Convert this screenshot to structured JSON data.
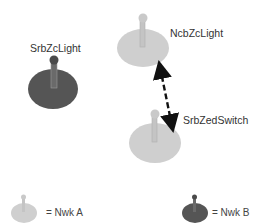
{
  "diagram": {
    "nodes": [
      {
        "id": "srbzclight",
        "label": "SrbZcLight",
        "network": "Nwk B"
      },
      {
        "id": "ncbzclight",
        "label": "NcbZcLight",
        "network": "Nwk A"
      },
      {
        "id": "srbzedswitch",
        "label": "SrbZedSwitch",
        "network": "Nwk A"
      }
    ],
    "edges": [
      {
        "from": "ncbzclight",
        "to": "srbzedswitch",
        "style": "dashed",
        "direction": "bidirectional"
      }
    ],
    "legend": [
      {
        "label": "= Nwk A",
        "color": "#cfcfcf"
      },
      {
        "label": "= Nwk B",
        "color": "#555555"
      }
    ]
  },
  "colors": {
    "nwk_a": "#cfcfcf",
    "nwk_a_dark": "#b8b8b8",
    "nwk_b": "#555555",
    "nwk_b_dark": "#3f3f3f",
    "arrow": "#111111"
  }
}
